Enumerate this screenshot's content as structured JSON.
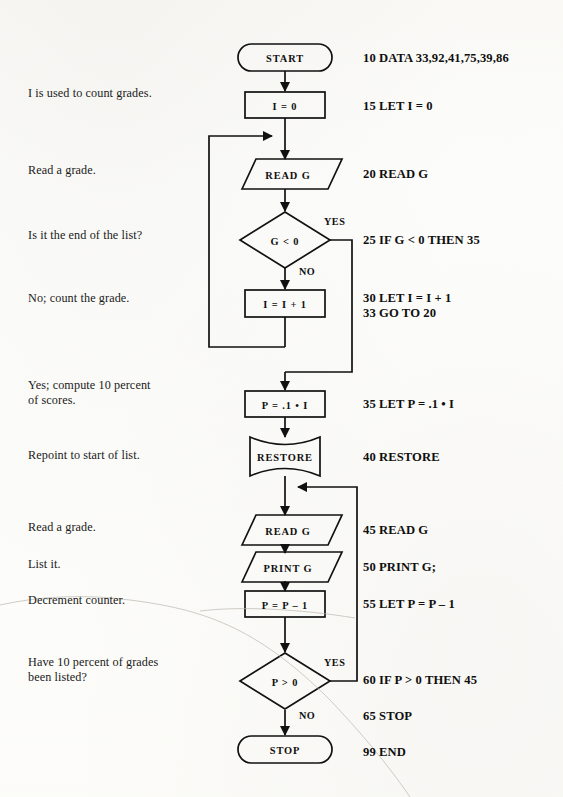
{
  "page": {
    "kind": "scanned-textbook-flowchart",
    "width": 563,
    "height": 797,
    "ink_color": "#111111",
    "paper_color": "#fdfdfb"
  },
  "annotations": [
    {
      "name": "annotation-count-grades",
      "text": "I is used to count grades.",
      "x": 28,
      "y": 93
    },
    {
      "name": "annotation-read-grade-1",
      "text": "Read a grade.",
      "x": 28,
      "y": 163
    },
    {
      "name": "annotation-end-of-list",
      "text": "Is it the end of the list?",
      "x": 28,
      "y": 233
    },
    {
      "name": "annotation-count-the-grade",
      "text": "No; count the grade.",
      "x": 28,
      "y": 290
    },
    {
      "name": "annotation-compute-percent",
      "text": "Yes; compute 10 percent\n  of scores.",
      "x": 28,
      "y": 383
    },
    {
      "name": "annotation-repoint",
      "text": "Repoint to start of list.",
      "x": 28,
      "y": 452
    },
    {
      "name": "annotation-read-grade-2",
      "text": "Read a grade.",
      "x": 28,
      "y": 522
    },
    {
      "name": "annotation-list-it",
      "text": "List it.",
      "x": 28,
      "y": 560
    },
    {
      "name": "annotation-decrement",
      "text": "Decrement counter.",
      "x": 28,
      "y": 596
    },
    {
      "name": "annotation-have-listed",
      "text": "Have 10 percent of grades\n  been listed?",
      "x": 28,
      "y": 640
    }
  ],
  "code_lines": [
    {
      "name": "code-10-data",
      "text": "10 DATA 33,92,41,75,39,86",
      "x": 363,
      "y": 52
    },
    {
      "name": "code-15-let",
      "text": "15 LET I = 0",
      "x": 363,
      "y": 100
    },
    {
      "name": "code-20-read",
      "text": "20 READ G",
      "x": 363,
      "y": 168
    },
    {
      "name": "code-25-if",
      "text": "25 IF G < 0 THEN 35",
      "x": 363,
      "y": 233
    },
    {
      "name": "code-30-33",
      "text": "30 LET I = I + 1\n33 GO TO 20",
      "x": 363,
      "y": 292
    },
    {
      "name": "code-35-let",
      "text": "35 LET P = .1 • I",
      "x": 363,
      "y": 398
    },
    {
      "name": "code-40-restore",
      "text": "40 RESTORE",
      "x": 363,
      "y": 452
    },
    {
      "name": "code-45-read",
      "text": "45 READ G",
      "x": 363,
      "y": 524
    },
    {
      "name": "code-50-print",
      "text": "50 PRINT G;",
      "x": 363,
      "y": 561
    },
    {
      "name": "code-55-let",
      "text": "55 LET P = P – 1",
      "x": 363,
      "y": 598
    },
    {
      "name": "code-60-if",
      "text": "60 IF P > 0 THEN 45",
      "x": 363,
      "y": 674
    },
    {
      "name": "code-65-stop",
      "text": "65 STOP",
      "x": 363,
      "y": 710
    },
    {
      "name": "code-99-end",
      "text": "99 END",
      "x": 363,
      "y": 746
    }
  ],
  "shapes": [
    {
      "name": "flow-start-terminator",
      "type": "terminator",
      "label": "START",
      "cx": 285,
      "cy": 57
    },
    {
      "name": "flow-init-i",
      "type": "process",
      "label": "I = 0",
      "cx": 285,
      "cy": 105
    },
    {
      "name": "flow-read-g-1",
      "type": "input-output",
      "label": "READ G",
      "cx": 285,
      "cy": 174
    },
    {
      "name": "flow-decision-g",
      "type": "decision",
      "label": "G < 0",
      "cx": 285,
      "cy": 240
    },
    {
      "name": "flow-increment-i",
      "type": "process",
      "label": "I = I + 1",
      "cx": 285,
      "cy": 303
    },
    {
      "name": "flow-compute-p",
      "type": "process",
      "label": "P = .1 • I",
      "cx": 285,
      "cy": 404
    },
    {
      "name": "flow-restore",
      "type": "stored-data",
      "label": "RESTORE",
      "cx": 285,
      "cy": 456
    },
    {
      "name": "flow-read-g-2",
      "type": "input-output",
      "label": "READ G",
      "cx": 285,
      "cy": 530
    },
    {
      "name": "flow-print-g",
      "type": "input-output",
      "label": "PRINT G",
      "cx": 285,
      "cy": 567
    },
    {
      "name": "flow-decrement-p",
      "type": "process",
      "label": "P = P – 1",
      "cx": 285,
      "cy": 604
    },
    {
      "name": "flow-decision-p",
      "type": "decision",
      "label": "P > 0",
      "cx": 285,
      "cy": 681
    },
    {
      "name": "flow-stop-terminator",
      "type": "terminator",
      "label": "STOP",
      "cx": 285,
      "cy": 750
    }
  ],
  "branch_labels": [
    {
      "name": "branch-yes-g",
      "text": "YES",
      "x": 323,
      "y": 216
    },
    {
      "name": "branch-no-g",
      "text": "NO",
      "x": 299,
      "y": 266
    },
    {
      "name": "branch-yes-p",
      "text": "YES",
      "x": 323,
      "y": 657
    },
    {
      "name": "branch-no-p",
      "text": "NO",
      "x": 299,
      "y": 710
    }
  ]
}
